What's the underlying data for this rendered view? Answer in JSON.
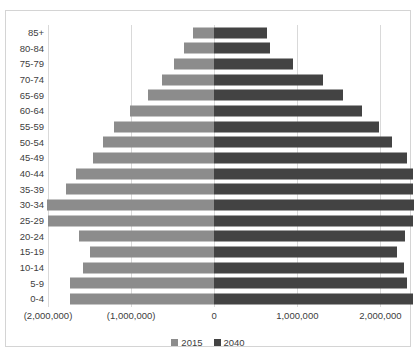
{
  "chart_data": {
    "type": "bar",
    "subtype": "population-pyramid",
    "title": "",
    "xlabel": "",
    "ylabel": "",
    "orientation": "horizontal",
    "grid": true,
    "legend_position": "bottom",
    "xlim": [
      -2000000,
      2500000
    ],
    "xticks": [
      -2000000,
      -1000000,
      0,
      1000000,
      2000000
    ],
    "xticklabels": [
      "(2,000,000)",
      "(1,000,000)",
      "0",
      "1,000,000",
      "2,000,000"
    ],
    "categories": [
      "0-4",
      "5-9",
      "10-14",
      "15-19",
      "20-24",
      "25-29",
      "30-34",
      "35-39",
      "40-44",
      "45-49",
      "50-54",
      "55-59",
      "60-64",
      "65-69",
      "70-74",
      "75-79",
      "80-84",
      "85+"
    ],
    "series": [
      {
        "name": "2015",
        "color": "#8c8c8c",
        "side": "left",
        "values": [
          -1733333,
          -1733333,
          -1573333,
          -1493333,
          -1626667,
          -2000000,
          -2013333,
          -1786667,
          -1666667,
          -1453333,
          -1333333,
          -1200000,
          -1013333,
          -800000,
          -626667,
          -480000,
          -360000,
          -253333
        ]
      },
      {
        "name": "2040",
        "color": "#434343",
        "side": "right",
        "values": [
          2386667,
          2320000,
          2280000,
          2200000,
          2293333,
          2386667,
          2400000,
          2386667,
          2386667,
          2320000,
          2133333,
          1986667,
          1773333,
          1546667,
          1306667,
          946667,
          666667,
          640000
        ]
      }
    ]
  },
  "legend": {
    "items": [
      {
        "label": "2015",
        "swatch_class": "s2015"
      },
      {
        "label": "2040",
        "swatch_class": "s2040"
      }
    ]
  }
}
